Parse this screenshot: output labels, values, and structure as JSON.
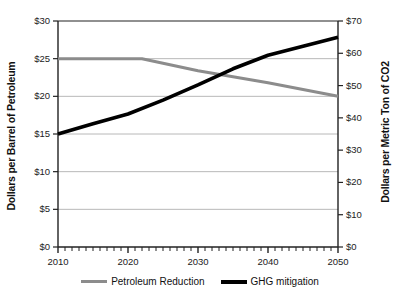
{
  "chart_data": {
    "type": "line",
    "title": "",
    "xlabel": "",
    "ylabel": "Dollars per Barrel of Petroleum",
    "y2label": "Dollars per Metric Ton of CO2",
    "xlim": [
      2010,
      2050
    ],
    "ylim": [
      0,
      30
    ],
    "y2lim": [
      0,
      70
    ],
    "xticks": [
      2010,
      2020,
      2030,
      2040,
      2050
    ],
    "xticklabels": [
      "2010",
      "2020",
      "2030",
      "2040",
      "2050"
    ],
    "yticks": [
      0,
      5,
      10,
      15,
      20,
      25,
      30
    ],
    "yticklabels": [
      "$0",
      "$5",
      "$10",
      "$15",
      "$20",
      "$25",
      "$30"
    ],
    "y2ticks": [
      0,
      10,
      20,
      30,
      40,
      50,
      60,
      70
    ],
    "y2ticklabels": [
      "$0",
      "$10",
      "$20",
      "$30",
      "$40",
      "$50",
      "$60",
      "$70"
    ],
    "grid": true,
    "minor_xticks": true,
    "legend_position": "bottom",
    "series": [
      {
        "name": "Petroleum Reduction",
        "axis": "left",
        "color": "#8c8c8c",
        "x": [
          2010,
          2015,
          2020,
          2022,
          2025,
          2030,
          2035,
          2040,
          2045,
          2050
        ],
        "values": [
          25,
          25,
          25,
          25,
          24.4,
          23.4,
          22.6,
          21.8,
          20.9,
          20
        ]
      },
      {
        "name": "GHG mitigation",
        "axis": "right",
        "color": "#000000",
        "x": [
          2010,
          2015,
          2020,
          2025,
          2030,
          2035,
          2040,
          2045,
          2050
        ],
        "values": [
          35,
          38.2,
          41.2,
          45.5,
          50.2,
          55.2,
          59.4,
          62.2,
          65
        ]
      }
    ]
  },
  "legend": {
    "entries": [
      {
        "label": "Petroleum Reduction",
        "color": "#8c8c8c"
      },
      {
        "label": "GHG mitigation",
        "color": "#000000"
      }
    ]
  }
}
